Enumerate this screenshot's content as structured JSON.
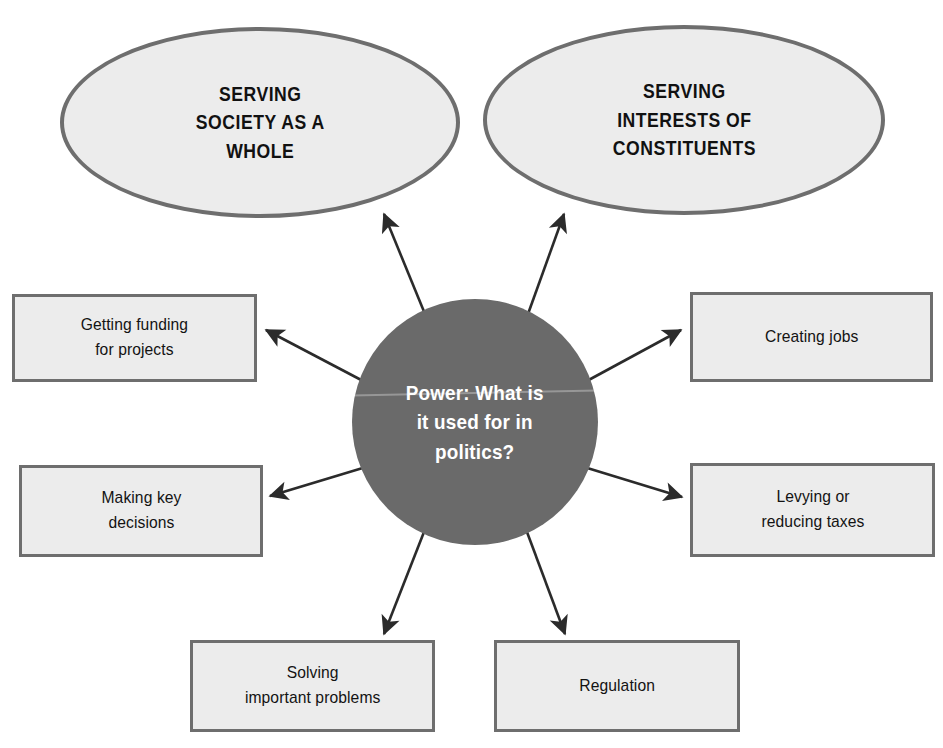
{
  "page": {
    "background_color": "#ffffff",
    "top_cut_text": "",
    "shape_fill": "#ececec",
    "shape_stroke": "#6e6e6e",
    "center_fill": "#6a6a6a",
    "center_text_color": "#ffffff",
    "arrow_color": "#2b2b2b"
  },
  "center": {
    "label": "Power: What is\nit used for in\npolitics?",
    "name": "power-question"
  },
  "ellipses": [
    {
      "label": "SERVING\nSOCIETY AS A\nWHOLE",
      "name": "serving-society-as-a-whole"
    },
    {
      "label": "SERVING\nINTERESTS OF\nCONSTITUENTS",
      "name": "serving-interests-of-constituents"
    }
  ],
  "boxes": [
    {
      "label": "Getting funding\nfor projects",
      "name": "getting-funding-for-projects"
    },
    {
      "label": "Making key\ndecisions",
      "name": "making-key-decisions"
    },
    {
      "label": "Creating jobs",
      "name": "creating-jobs"
    },
    {
      "label": "Levying or\nreducing taxes",
      "name": "levying-or-reducing-taxes"
    },
    {
      "label": "Solving\nimportant problems",
      "name": "solving-important-problems"
    },
    {
      "label": "Regulation",
      "name": "regulation"
    }
  ],
  "arrows": [
    {
      "name": "arrow-to-serving-society",
      "from": "center",
      "to": "serving-society-as-a-whole"
    },
    {
      "name": "arrow-to-serving-constituents",
      "from": "center",
      "to": "serving-interests-of-constituents"
    },
    {
      "name": "arrow-to-getting-funding",
      "from": "center",
      "to": "getting-funding-for-projects"
    },
    {
      "name": "arrow-to-making-key-decisions",
      "from": "center",
      "to": "making-key-decisions"
    },
    {
      "name": "arrow-to-creating-jobs",
      "from": "center",
      "to": "creating-jobs"
    },
    {
      "name": "arrow-to-levying-taxes",
      "from": "center",
      "to": "levying-or-reducing-taxes"
    },
    {
      "name": "arrow-to-solving-problems",
      "from": "center",
      "to": "solving-important-problems"
    },
    {
      "name": "arrow-to-regulation",
      "from": "center",
      "to": "regulation"
    }
  ]
}
